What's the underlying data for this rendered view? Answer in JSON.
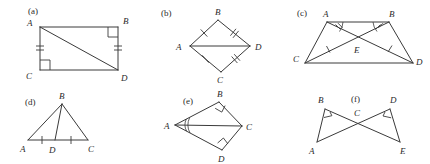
{
  "figure": {
    "kind": "geometry-figure-set",
    "background_color": "#ffffff",
    "line_color": "#3a3a3a",
    "label_color": "#2a2a2a"
  },
  "panels": [
    {
      "id": "a",
      "caption": "(a)",
      "shape": "square-with-diagonal",
      "vertices": [
        {
          "name": "A",
          "label": "A"
        },
        {
          "name": "B",
          "label": "B"
        },
        {
          "name": "C",
          "label": "C"
        },
        {
          "name": "D",
          "label": "D"
        }
      ],
      "segments": [
        "AB",
        "BD",
        "DC",
        "CA",
        "AD"
      ],
      "right_angles": [
        "B",
        "C"
      ],
      "congruent_marks": [
        {
          "segment": "CA",
          "ticks": 2
        },
        {
          "segment": "BD",
          "ticks": 2
        }
      ]
    },
    {
      "id": "b",
      "caption": "(b)",
      "shape": "kite-with-horizontal-diagonal",
      "vertices": [
        {
          "name": "A",
          "label": "A"
        },
        {
          "name": "B",
          "label": "B"
        },
        {
          "name": "C",
          "label": "C"
        },
        {
          "name": "D",
          "label": "D"
        }
      ],
      "segments": [
        "AB",
        "BD",
        "DC",
        "CA",
        "AD"
      ],
      "right_angles": [],
      "congruent_marks": [
        {
          "segment": "AB",
          "ticks": 1
        },
        {
          "segment": "CA",
          "ticks": 1
        },
        {
          "segment": "BD",
          "ticks": 2
        },
        {
          "segment": "DC",
          "ticks": 2
        }
      ]
    },
    {
      "id": "c",
      "caption": "(c)",
      "shape": "trapezoid-with-diagonals",
      "vertices": [
        {
          "name": "A",
          "label": "A"
        },
        {
          "name": "B",
          "label": "B"
        },
        {
          "name": "C",
          "label": "C"
        },
        {
          "name": "D",
          "label": "D"
        },
        {
          "name": "E",
          "label": "E"
        }
      ],
      "segments": [
        "AB",
        "AC",
        "BD",
        "CD",
        "AD",
        "BC"
      ],
      "intersection_point": "E",
      "angle_marks": [
        {
          "vertex": "A",
          "arcs": 1,
          "ticks": 2
        },
        {
          "vertex": "B",
          "arcs": 1,
          "ticks": 2
        }
      ],
      "congruent_marks": [
        {
          "segment": "AE",
          "ticks": 2
        },
        {
          "segment": "BE",
          "ticks": 2
        },
        {
          "segment": "CE",
          "ticks": 1
        },
        {
          "segment": "ED",
          "ticks": 1
        }
      ]
    },
    {
      "id": "d",
      "caption": "(d)",
      "shape": "triangle-with-cevian",
      "vertices": [
        {
          "name": "A",
          "label": "A"
        },
        {
          "name": "B",
          "label": "B"
        },
        {
          "name": "C",
          "label": "C"
        },
        {
          "name": "D",
          "label": "D"
        }
      ],
      "segments": [
        "AB",
        "BC",
        "AC",
        "BD"
      ],
      "right_angles": [],
      "congruent_marks": [
        {
          "segment": "AD",
          "ticks": 1
        },
        {
          "segment": "DC",
          "ticks": 1
        }
      ]
    },
    {
      "id": "e",
      "caption": "(e)",
      "shape": "two-right-triangles-sharing-hypotenuse",
      "vertices": [
        {
          "name": "A",
          "label": "A"
        },
        {
          "name": "B",
          "label": "B"
        },
        {
          "name": "C",
          "label": "C"
        },
        {
          "name": "D",
          "label": "D"
        }
      ],
      "segments": [
        "AB",
        "BC",
        "AC",
        "AD",
        "DC"
      ],
      "right_angles": [
        "B",
        "D"
      ],
      "angle_marks": [
        {
          "vertex": "A",
          "arcs": 2,
          "ticks": 0
        }
      ]
    },
    {
      "id": "f",
      "caption": "(f)",
      "shape": "bowtie-two-right-triangles",
      "vertices": [
        {
          "name": "A",
          "label": "A"
        },
        {
          "name": "B",
          "label": "B"
        },
        {
          "name": "C",
          "label": "C"
        },
        {
          "name": "D",
          "label": "D"
        },
        {
          "name": "E",
          "label": "E"
        }
      ],
      "segments": [
        "AB",
        "BE",
        "AD",
        "DE"
      ],
      "intersection_point": "C",
      "right_angles": [
        "B",
        "D"
      ]
    }
  ]
}
